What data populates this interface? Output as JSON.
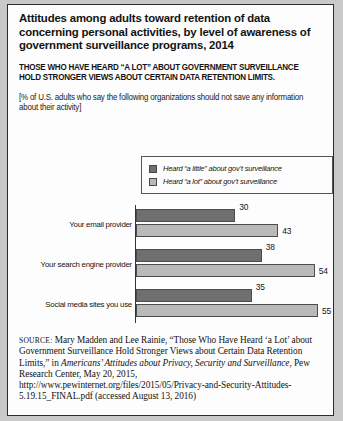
{
  "figure": {
    "title": "Attitudes among adults toward retention of data concerning personal activities, by level of awareness of government surveillance programs, 2014",
    "subtitle": "THOSE WHO HAVE HEARD “A LOT” ABOUT GOVERNMENT SURVEILLANCE HOLD STRONGER VIEWS ABOUT CERTAIN DATA RETENTION LIMITS.",
    "note": "[% of U.S. adults who say the following organizations should not save any information about their activity]"
  },
  "legend": {
    "items": [
      {
        "label": "Heard “a little” about gov’t surveillance",
        "color": "#6f6f6f"
      },
      {
        "label": "Heard “a lot” about gov’t surveillance",
        "color": "#b9b9b9"
      }
    ]
  },
  "chart_data": {
    "type": "bar",
    "orientation": "horizontal",
    "title": "Attitudes among adults toward retention of data concerning personal activities, by level of awareness of government surveillance programs, 2014",
    "subtitle": "THOSE WHO HAVE HEARD “A LOT” ABOUT GOVERNMENT SURVEILLANCE HOLD STRONGER VIEWS ABOUT CERTAIN DATA RETENTION LIMITS.",
    "xlabel": "",
    "ylabel": "",
    "xlim": [
      0,
      60
    ],
    "grid": false,
    "legend_position": "above-plot-right",
    "categories": [
      "Your email provider",
      "Your search engine provider",
      "Social media sites you use"
    ],
    "series": [
      {
        "name": "Heard “a little” about gov’t surveillance",
        "color": "#6f6f6f",
        "values": [
          30,
          38,
          35
        ]
      },
      {
        "name": "Heard “a lot” about gov’t surveillance",
        "color": "#b9b9b9",
        "values": [
          43,
          54,
          55
        ]
      }
    ],
    "value_labels": [
      "30",
      "43",
      "38",
      "54",
      "35",
      "55"
    ]
  },
  "source": {
    "prefix": "SOURCE:",
    "text_1": " Mary Madden and Lee Rainie, “Those Who Have Heard ‘a Lot’ about Government Surveillance Hold Stronger Views about Certain Data Retention Limits,” in ",
    "publication": "Americans’ Attitudes about Privacy, Security and Surveillance",
    "text_2": ", Pew Research Center, May 20, 2015, http://www.pewinternet.org/files/2015/05/Privacy-and-Security-Attitudes-5.19.15_FINAL.pdf (accessed August 13, 2016)"
  }
}
